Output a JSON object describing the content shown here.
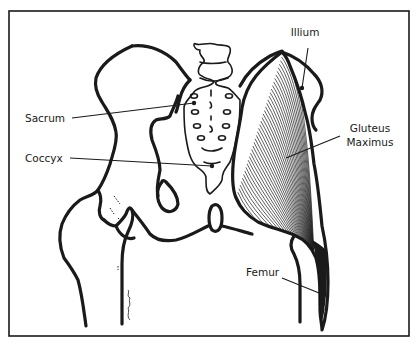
{
  "figure": {
    "labels": {
      "illium": "Illium",
      "sacrum": "Sacrum",
      "coccyx": "Coccyx",
      "gluteus_line1": "Gluteus",
      "gluteus_line2": "Maximus",
      "femur": "Femur"
    },
    "colors": {
      "ink": "#1a1a1a",
      "paper": "#ffffff"
    }
  }
}
